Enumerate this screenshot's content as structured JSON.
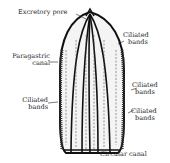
{
  "diagram": {
    "labels": {
      "excretory_pore": "Excretory pore",
      "ciliated_bands_top_right_1": "Ciliated",
      "ciliated_bands_top_right_2": "bands",
      "paragastric_canal_1": "Paragastric",
      "paragastric_canal_2": "canal",
      "ciliated_bands_mid_right_1": "Ciliated",
      "ciliated_bands_mid_right_2": "bands",
      "ciliated_bands_left_1": "Ciliated",
      "ciliated_bands_left_2": "bands",
      "ciliated_bands_low_right_1": "Ciliated",
      "ciliated_bands_low_right_2": "bands",
      "circular_canal": "Circular canal"
    }
  }
}
